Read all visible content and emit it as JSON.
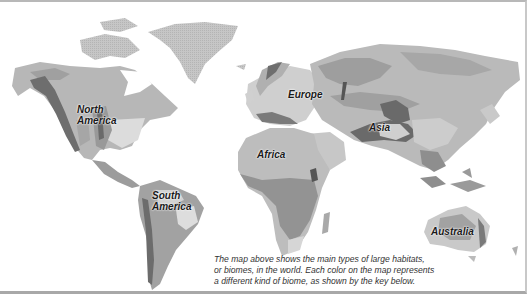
{
  "map": {
    "type": "world biome map",
    "style": "grayscale",
    "labels": {
      "north_america": [
        "North",
        "America"
      ],
      "south_america": [
        "South",
        "America"
      ],
      "europe": "Europe",
      "africa": "Africa",
      "asia": "Asia",
      "australia": "Australia"
    },
    "caption_lines": [
      "The map above shows the main types of large habitats,",
      "or biomes, in the world. Each color on the map represents",
      "a different kind of biome, as shown by the key below."
    ],
    "colors": {
      "tundra": "#c9c9c9",
      "taiga": "#b2b2b2",
      "grassland": "#a3a3a3",
      "mountain": "#6e6e6e",
      "desert": "#bdbdbd",
      "rainforest": "#8e8e8e",
      "temperate": "#dcdcdc",
      "ice": "#e6e6e6",
      "ocean": "#ffffff"
    }
  }
}
